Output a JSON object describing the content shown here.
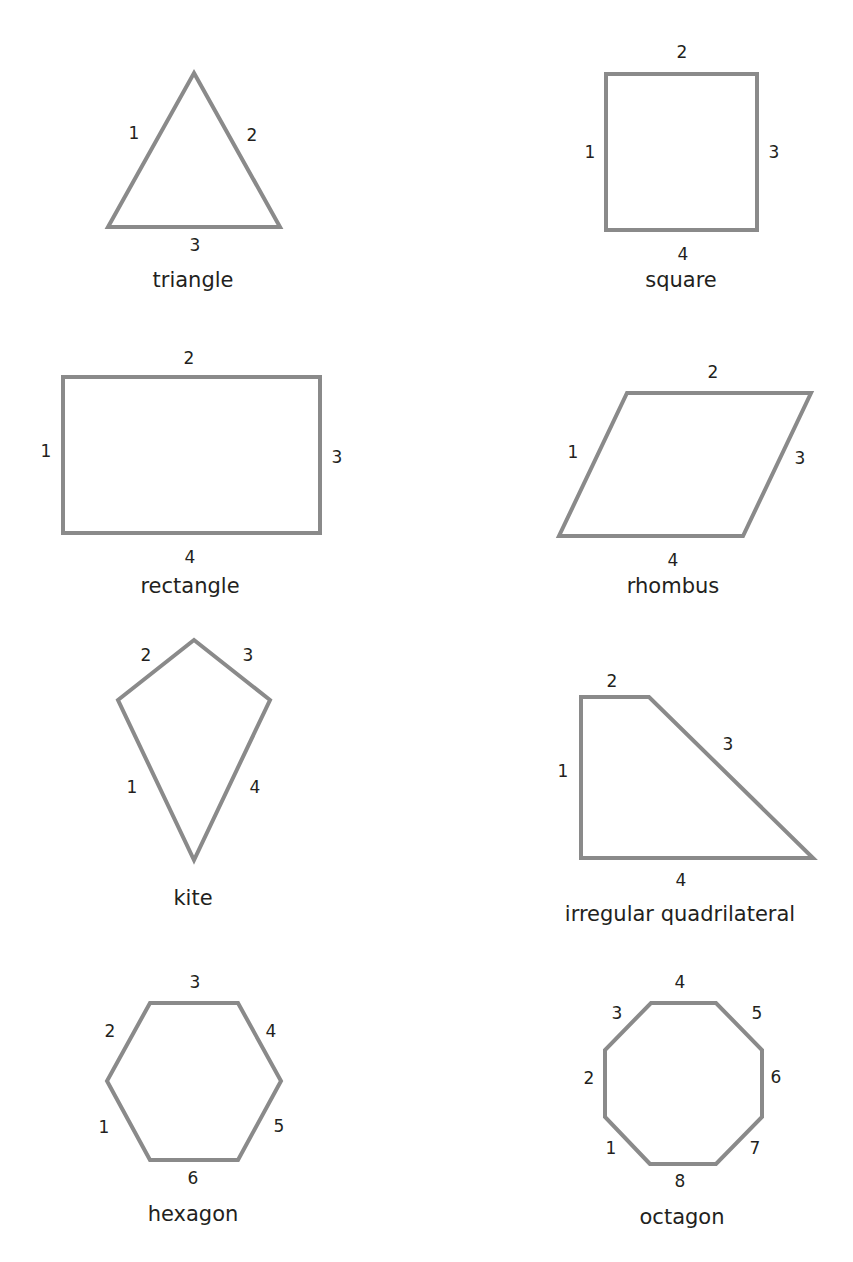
{
  "diagram": {
    "stroke_color": "#8a8a8a",
    "text_color": "#231f20",
    "background": "#ffffff",
    "shapes": [
      {
        "id": "triangle",
        "name": "triangle",
        "name_pos": [
          193,
          281
        ],
        "points": [
          [
            194,
            73
          ],
          [
            280,
            227
          ],
          [
            108,
            227
          ]
        ],
        "sides": [
          {
            "label": "1",
            "pos": [
              134,
              134
            ]
          },
          {
            "label": "2",
            "pos": [
              252,
              136
            ]
          },
          {
            "label": "3",
            "pos": [
              195,
              246
            ]
          }
        ]
      },
      {
        "id": "square",
        "name": "square",
        "name_pos": [
          681,
          281
        ],
        "points": [
          [
            606,
            74
          ],
          [
            757,
            74
          ],
          [
            757,
            230
          ],
          [
            606,
            230
          ]
        ],
        "sides": [
          {
            "label": "1",
            "pos": [
              590,
              153
            ]
          },
          {
            "label": "2",
            "pos": [
              682,
              53
            ]
          },
          {
            "label": "3",
            "pos": [
              774,
              153
            ]
          },
          {
            "label": "4",
            "pos": [
              683,
              255
            ]
          }
        ]
      },
      {
        "id": "rectangle",
        "name": "rectangle",
        "name_pos": [
          190,
          587
        ],
        "points": [
          [
            63,
            377
          ],
          [
            320,
            377
          ],
          [
            320,
            533
          ],
          [
            63,
            533
          ]
        ],
        "sides": [
          {
            "label": "1",
            "pos": [
              46,
              452
            ]
          },
          {
            "label": "2",
            "pos": [
              189,
              359
            ]
          },
          {
            "label": "3",
            "pos": [
              337,
              458
            ]
          },
          {
            "label": "4",
            "pos": [
              190,
              558
            ]
          }
        ]
      },
      {
        "id": "rhombus",
        "name": "rhombus",
        "name_pos": [
          673,
          587
        ],
        "points": [
          [
            627,
            393
          ],
          [
            811,
            393
          ],
          [
            743,
            536
          ],
          [
            559,
            536
          ]
        ],
        "sides": [
          {
            "label": "1",
            "pos": [
              573,
              453
            ]
          },
          {
            "label": "2",
            "pos": [
              713,
              373
            ]
          },
          {
            "label": "3",
            "pos": [
              800,
              459
            ]
          },
          {
            "label": "4",
            "pos": [
              673,
              561
            ]
          }
        ]
      },
      {
        "id": "kite",
        "name": "kite",
        "name_pos": [
          193,
          899
        ],
        "points": [
          [
            118,
            700
          ],
          [
            194,
            640
          ],
          [
            270,
            700
          ],
          [
            194,
            860
          ]
        ],
        "sides": [
          {
            "label": "1",
            "pos": [
              132,
              788
            ]
          },
          {
            "label": "2",
            "pos": [
              146,
              656
            ]
          },
          {
            "label": "3",
            "pos": [
              248,
              656
            ]
          },
          {
            "label": "4",
            "pos": [
              255,
              788
            ]
          }
        ]
      },
      {
        "id": "irregular-quadrilateral",
        "name": "irregular quadrilateral",
        "name_pos": [
          680,
          915
        ],
        "points": [
          [
            581,
            697
          ],
          [
            581,
            858
          ],
          [
            813,
            858
          ],
          [
            649,
            697
          ]
        ],
        "sides": [
          {
            "label": "1",
            "pos": [
              563,
              772
            ]
          },
          {
            "label": "2",
            "pos": [
              612,
              682
            ]
          },
          {
            "label": "3",
            "pos": [
              728,
              745
            ]
          },
          {
            "label": "4",
            "pos": [
              681,
              881
            ]
          }
        ]
      },
      {
        "id": "hexagon",
        "name": "hexagon",
        "name_pos": [
          193,
          1215
        ],
        "points": [
          [
            150,
            1160
          ],
          [
            107,
            1081
          ],
          [
            150,
            1003
          ],
          [
            238,
            1003
          ],
          [
            281,
            1081
          ],
          [
            238,
            1160
          ]
        ],
        "sides": [
          {
            "label": "1",
            "pos": [
              104,
              1128
            ]
          },
          {
            "label": "2",
            "pos": [
              110,
              1032
            ]
          },
          {
            "label": "3",
            "pos": [
              195,
              983
            ]
          },
          {
            "label": "4",
            "pos": [
              271,
              1032
            ]
          },
          {
            "label": "5",
            "pos": [
              279,
              1127
            ]
          },
          {
            "label": "6",
            "pos": [
              193,
              1179
            ]
          }
        ]
      },
      {
        "id": "octagon",
        "name": "octagon",
        "name_pos": [
          682,
          1218
        ],
        "points": [
          [
            650,
            1164
          ],
          [
            605,
            1117
          ],
          [
            605,
            1050
          ],
          [
            651,
            1003
          ],
          [
            716,
            1003
          ],
          [
            762,
            1050
          ],
          [
            762,
            1117
          ],
          [
            716,
            1164
          ]
        ],
        "sides": [
          {
            "label": "1",
            "pos": [
              611,
              1149
            ]
          },
          {
            "label": "2",
            "pos": [
              589,
              1079
            ]
          },
          {
            "label": "3",
            "pos": [
              617,
              1014
            ]
          },
          {
            "label": "4",
            "pos": [
              680,
              983
            ]
          },
          {
            "label": "5",
            "pos": [
              757,
              1014
            ]
          },
          {
            "label": "6",
            "pos": [
              776,
              1078
            ]
          },
          {
            "label": "7",
            "pos": [
              755,
              1149
            ]
          },
          {
            "label": "8",
            "pos": [
              680,
              1182
            ]
          }
        ]
      }
    ]
  }
}
